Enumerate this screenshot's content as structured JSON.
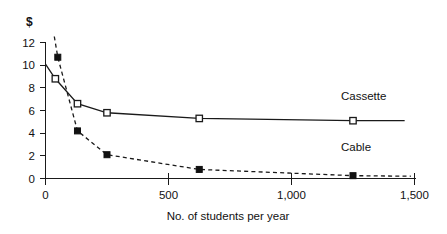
{
  "chart_data": {
    "type": "line",
    "title": "",
    "xlabel": "No. of students per year",
    "ylabel": "$",
    "xlim": [
      0,
      1500
    ],
    "ylim": [
      0,
      12
    ],
    "grid": false,
    "legend_position": "inline-right",
    "xticks": [
      0,
      500,
      1000,
      1500
    ],
    "xticklabels": [
      "0",
      "500",
      "1,000",
      "1,500"
    ],
    "yticks": [
      0,
      2,
      4,
      6,
      8,
      10,
      12
    ],
    "yticklabels": [
      "0",
      "2",
      "4",
      "6",
      "8",
      "10",
      "12"
    ],
    "series": [
      {
        "name": "Cassette",
        "marker": "open-square",
        "linestyle": "solid",
        "x": [
          40,
          130,
          250,
          625,
          1250,
          1460
        ],
        "values": [
          8.8,
          6.6,
          5.8,
          5.3,
          5.1,
          5.1
        ],
        "label_x": 1180,
        "label_y": 6.5
      },
      {
        "name": "Cable",
        "marker": "filled-square",
        "linestyle": "dashed",
        "x": [
          50,
          130,
          250,
          625,
          1250,
          1485
        ],
        "values": [
          10.7,
          4.2,
          2.1,
          0.8,
          0.25,
          0.2
        ],
        "label_x": 1180,
        "label_y": 2.2
      }
    ],
    "annotations": [
      {
        "name": "cable-offscale-segment",
        "note": "dashed line continues above y=12 at left edge"
      }
    ],
    "colors": {
      "ink": "#111111",
      "axis": "#1a1a1a",
      "background": "#ffffff",
      "marker_fill_open": "#ffffff",
      "marker_fill_closed": "#111111"
    }
  },
  "labels": {
    "y_axis_unit": "$",
    "x_axis_title": "No. of students per year",
    "series_cassette": "Cassette",
    "series_cable": "Cable",
    "xtick_0": "0",
    "xtick_500": "500",
    "xtick_1000": "1,000",
    "xtick_1500": "1,500",
    "ytick_0": "0",
    "ytick_2": "2",
    "ytick_4": "4",
    "ytick_6": "6",
    "ytick_8": "8",
    "ytick_10": "10",
    "ytick_12": "12"
  }
}
